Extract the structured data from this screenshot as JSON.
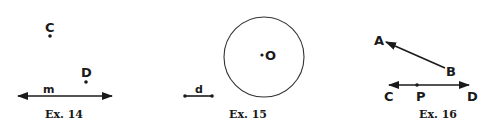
{
  "figures": [
    {
      "caption": "Ex. 14",
      "points": [
        {
          "label": "C"
        },
        {
          "label": "D"
        }
      ],
      "line": {
        "label": "m"
      }
    },
    {
      "caption": "Ex. 15",
      "circle_center": {
        "label": "O"
      },
      "segment": {
        "label": "d"
      }
    },
    {
      "caption": "Ex. 16",
      "ray": {
        "from": "B",
        "toward": "A",
        "labels": [
          "A",
          "B"
        ]
      },
      "line": {
        "labels": [
          "C",
          "P",
          "D"
        ]
      }
    }
  ],
  "colors": {
    "ink": "#1a1a1a",
    "background": "#ffffff"
  }
}
